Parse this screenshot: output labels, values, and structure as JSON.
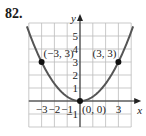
{
  "problem_number": "82.",
  "chart_data": {
    "type": "line",
    "title": "",
    "function": "y = x^2/3",
    "xlabel": "x",
    "ylabel": "y",
    "xlim": [
      -4,
      4
    ],
    "ylim": [
      -2,
      6
    ],
    "grid": true,
    "x_tick_labels": [
      "-3",
      "-2",
      "-1",
      "3"
    ],
    "x_tick_values": [
      -3,
      -2,
      -1,
      3
    ],
    "y_tick_labels": [
      "-1",
      "1",
      "2",
      "3",
      "4",
      "5"
    ],
    "y_tick_values": [
      -1,
      1,
      2,
      3,
      4,
      5
    ],
    "series": [
      {
        "name": "parabola",
        "x": [
          -4,
          -3,
          -2,
          -1,
          0,
          1,
          2,
          3,
          4
        ],
        "y": [
          5.33,
          3,
          1.33,
          0.33,
          0,
          0.33,
          1.33,
          3,
          5.33
        ]
      }
    ],
    "points": [
      {
        "x": -3,
        "y": 3,
        "label": "(−3, 3)"
      },
      {
        "x": 0,
        "y": 0,
        "label": "(0, 0)"
      },
      {
        "x": 3,
        "y": 3,
        "label": "(3, 3)"
      }
    ]
  },
  "colors": {
    "curve": "#555555",
    "grid": "#bbbbbb",
    "axis": "#222222",
    "point": "#111111"
  }
}
